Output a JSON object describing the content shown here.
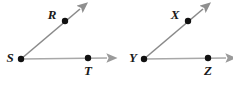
{
  "figure": {
    "width": 233,
    "height": 93,
    "background_color": "#ffffff"
  },
  "style": {
    "diagonal_ray_color": "#8a8a8a",
    "horizontal_ray_color": "#a8a8a8",
    "arrowhead_color": "#8f8f8f",
    "point_color": "#111111",
    "label_color": "#1a1a1a",
    "ray_stroke_width": 1.6,
    "point_radius": 3.2
  },
  "diagrams": [
    {
      "name": "angle-rst",
      "vertex": {
        "label": "S",
        "x": 21,
        "y": 59,
        "label_x": 10,
        "label_y": 59
      },
      "points": [
        {
          "label": "R",
          "x": 65,
          "y": 21,
          "label_x": 52,
          "label_y": 16
        },
        {
          "label": "T",
          "x": 88,
          "y": 58,
          "label_x": 88,
          "label_y": 72
        }
      ],
      "rays": [
        {
          "name": "ray-sr",
          "from_x": 21,
          "from_y": 59,
          "to_x": 82,
          "to_y": 7,
          "kind": "diagonal"
        },
        {
          "name": "ray-st",
          "from_x": 21,
          "from_y": 59,
          "to_x": 110,
          "to_y": 58,
          "kind": "horizontal"
        }
      ]
    },
    {
      "name": "angle-xyz",
      "vertex": {
        "label": "Y",
        "x": 144,
        "y": 59,
        "label_x": 133,
        "label_y": 59
      },
      "points": [
        {
          "label": "X",
          "x": 188,
          "y": 21,
          "label_x": 175,
          "label_y": 16
        },
        {
          "label": "Z",
          "x": 208,
          "y": 58,
          "label_x": 208,
          "label_y": 72
        }
      ],
      "rays": [
        {
          "name": "ray-yx",
          "from_x": 144,
          "from_y": 59,
          "to_x": 205,
          "to_y": 7,
          "kind": "diagonal"
        },
        {
          "name": "ray-yz",
          "from_x": 144,
          "from_y": 59,
          "to_x": 229,
          "to_y": 58,
          "kind": "horizontal"
        }
      ]
    }
  ]
}
